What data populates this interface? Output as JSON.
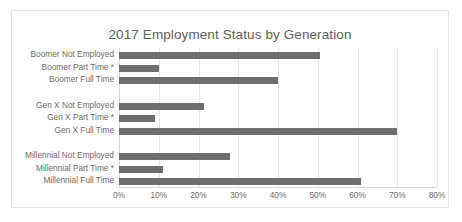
{
  "chart_data": {
    "type": "bar",
    "orientation": "horizontal",
    "title": "2017 Employment Status by Generation",
    "xlabel": "",
    "ylabel": "",
    "xlim": [
      0,
      80
    ],
    "x_tick_labels": [
      "0%",
      "10%",
      "20%",
      "30%",
      "40%",
      "50%",
      "60%",
      "70%",
      "80%"
    ],
    "x_ticks": [
      0,
      10,
      20,
      30,
      40,
      50,
      60,
      70,
      80
    ],
    "grid": true,
    "legend": "none",
    "bar_color": "#6e6e6e",
    "categories": [
      "Boomer Not Employed",
      "Boomer Part Time *",
      "Boomer Full Time",
      "",
      "Gen X Not Employed",
      "Gen X Part Time *",
      "Gen X Full Time",
      "",
      "Millennial Not Employed",
      "Millennial Part Time *",
      "Millennial Full Time"
    ],
    "values": [
      50.5,
      10,
      40,
      null,
      21.5,
      9,
      70,
      null,
      28,
      11,
      61
    ],
    "bars": [
      {
        "label": "Boomer Not Employed",
        "value": 50.5
      },
      {
        "label": "Boomer Part Time *",
        "value": 10
      },
      {
        "label": "Boomer Full Time",
        "value": 40
      },
      {
        "label": "",
        "value": null
      },
      {
        "label": "Gen X Not Employed",
        "value": 21.5
      },
      {
        "label": "Gen X Part Time *",
        "value": 9
      },
      {
        "label": "Gen X Full Time",
        "value": 70
      },
      {
        "label": "",
        "value": null
      },
      {
        "label": "Millennial Not Employed",
        "value": 28
      },
      {
        "label": "Millennial Part Time *",
        "value": 11
      },
      {
        "label": "Millennial Full Time",
        "value": 61
      }
    ]
  }
}
